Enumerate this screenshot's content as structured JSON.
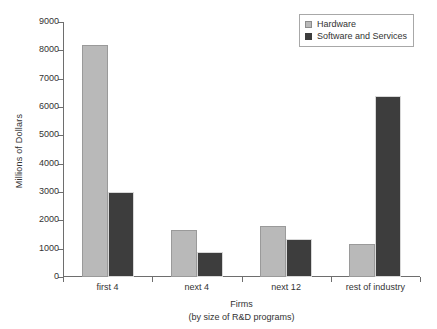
{
  "chart_data": {
    "type": "bar",
    "title": "",
    "xlabel": "Firms",
    "xlabel_sub": "(by size of R&D programs)",
    "ylabel": "Millions of Dollars",
    "ylim": [
      0,
      9000
    ],
    "ytick_step": 1000,
    "yticks": [
      0,
      1000,
      2000,
      3000,
      4000,
      5000,
      6000,
      7000,
      8000,
      9000
    ],
    "ytick_labels": [
      "0",
      "1000",
      "2000",
      "3000",
      "4000",
      "5000",
      "6000",
      "7000",
      "8000",
      "9000"
    ],
    "grid": false,
    "legend_position": "top-right",
    "categories": [
      "first 4",
      "next 4",
      "next 12",
      "rest of industry"
    ],
    "series": [
      {
        "name": "Hardware",
        "color": "#b9b9b9",
        "values": [
          8200,
          1660,
          1800,
          1170
        ]
      },
      {
        "name": "Software and Services",
        "color": "#3d3d3d",
        "values": [
          3000,
          880,
          1350,
          6400
        ]
      }
    ]
  },
  "legend": {
    "items": [
      {
        "label": "Hardware",
        "swatch": "hardware"
      },
      {
        "label": "Software and Services",
        "swatch": "software"
      }
    ]
  }
}
